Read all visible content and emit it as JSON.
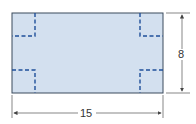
{
  "diagram": {
    "shape": "rectangle",
    "fill_color": "#d3e0ef",
    "border_color": "#3a4a5c",
    "cut_line_color": "#1f4f9a",
    "width_label": "15",
    "height_label": "8",
    "corner_cuts": [
      "top-left",
      "top-right",
      "bottom-left",
      "bottom-right"
    ]
  }
}
